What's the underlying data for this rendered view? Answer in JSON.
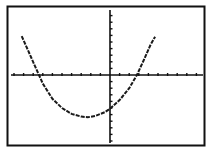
{
  "screen": {
    "type": "graphing-calculator-display",
    "frame_color": "#111111",
    "background": "#ffffff",
    "plot_color": "#1a1a1a"
  },
  "chart_data": {
    "type": "line",
    "title": "",
    "xlabel": "",
    "ylabel": "",
    "xlim": [
      -10,
      10
    ],
    "ylim": [
      -10,
      10
    ],
    "grid": false,
    "axes": true,
    "x_tick_step": 1,
    "y_tick_step": 1,
    "legend": null,
    "function": "parabola opening upward",
    "roots": [
      -7.4,
      2.8
    ],
    "vertex": [
      -2.3,
      -6.4
    ],
    "y_intercept": -5.1,
    "series": [
      {
        "name": "Y1",
        "x": [
          -9.2,
          -8.5,
          -7.8,
          -7.4,
          -7.0,
          -6.0,
          -5.0,
          -4.0,
          -3.0,
          -2.3,
          -1.5,
          -0.5,
          0.0,
          1.0,
          2.0,
          2.8,
          3.5,
          4.2,
          4.7
        ],
        "y": [
          5.9,
          3.6,
          1.3,
          0.0,
          -1.3,
          -3.6,
          -5.0,
          -5.9,
          -6.3,
          -6.4,
          -6.2,
          -5.6,
          -5.1,
          -3.8,
          -2.0,
          0.0,
          2.2,
          4.5,
          5.8
        ]
      }
    ]
  }
}
